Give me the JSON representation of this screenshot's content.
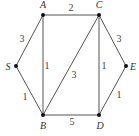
{
  "graph": {
    "nodes": [
      {
        "id": "A",
        "label": "A",
        "x": 43,
        "y": 15,
        "lx": 43,
        "ly": 8
      },
      {
        "id": "C",
        "label": "C",
        "x": 99,
        "y": 15,
        "lx": 99,
        "ly": 8
      },
      {
        "id": "S",
        "label": "S",
        "x": 16,
        "y": 66,
        "lx": 8,
        "ly": 70
      },
      {
        "id": "E",
        "label": "E",
        "x": 126,
        "y": 66,
        "lx": 133,
        "ly": 70
      },
      {
        "id": "B",
        "label": "B",
        "x": 43,
        "y": 115,
        "lx": 43,
        "ly": 129
      },
      {
        "id": "D",
        "label": "D",
        "x": 99,
        "y": 115,
        "lx": 100,
        "ly": 129
      }
    ],
    "edges": [
      {
        "from": "A",
        "to": "C",
        "weight": "2",
        "wx": 71,
        "wy": 11
      },
      {
        "from": "S",
        "to": "A",
        "weight": "3",
        "wx": 22,
        "wy": 42
      },
      {
        "from": "S",
        "to": "B",
        "weight": "1",
        "wx": 25,
        "wy": 100
      },
      {
        "from": "A",
        "to": "B",
        "weight": "1",
        "wx": 47,
        "wy": 69
      },
      {
        "from": "B",
        "to": "C",
        "weight": "3",
        "wx": 74,
        "wy": 78
      },
      {
        "from": "C",
        "to": "D",
        "weight": "1",
        "wx": 104,
        "wy": 69
      },
      {
        "from": "C",
        "to": "E",
        "weight": "3",
        "wx": 119,
        "wy": 42
      },
      {
        "from": "D",
        "to": "E",
        "weight": "1",
        "wx": 119,
        "wy": 98
      },
      {
        "from": "B",
        "to": "D",
        "weight": "5",
        "wx": 72,
        "wy": 125
      }
    ]
  }
}
